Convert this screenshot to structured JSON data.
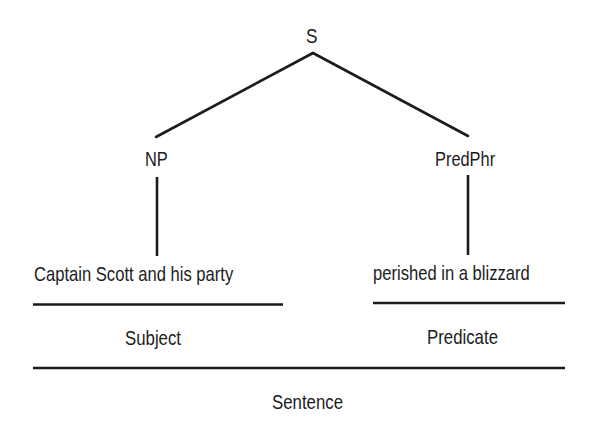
{
  "diagram": {
    "type": "syntax-tree",
    "colors": {
      "background": "#ffffff",
      "ink": "#1c1c1c"
    },
    "nodes": {
      "root": {
        "label": "S"
      },
      "np": {
        "label": "NP"
      },
      "predphr": {
        "label": "PredPhr"
      }
    },
    "leaves": {
      "subject_phrase": "Captain Scott and his party",
      "predicate_phrase": "perished in a blizzard"
    },
    "functions": {
      "subject": "Subject",
      "predicate": "Predicate",
      "sentence": "Sentence"
    },
    "edges": [
      {
        "from": "S",
        "to": "NP"
      },
      {
        "from": "S",
        "to": "PredPhr"
      },
      {
        "from": "NP",
        "to": "Captain Scott and his party"
      },
      {
        "from": "PredPhr",
        "to": "perished in a blizzard"
      }
    ]
  }
}
